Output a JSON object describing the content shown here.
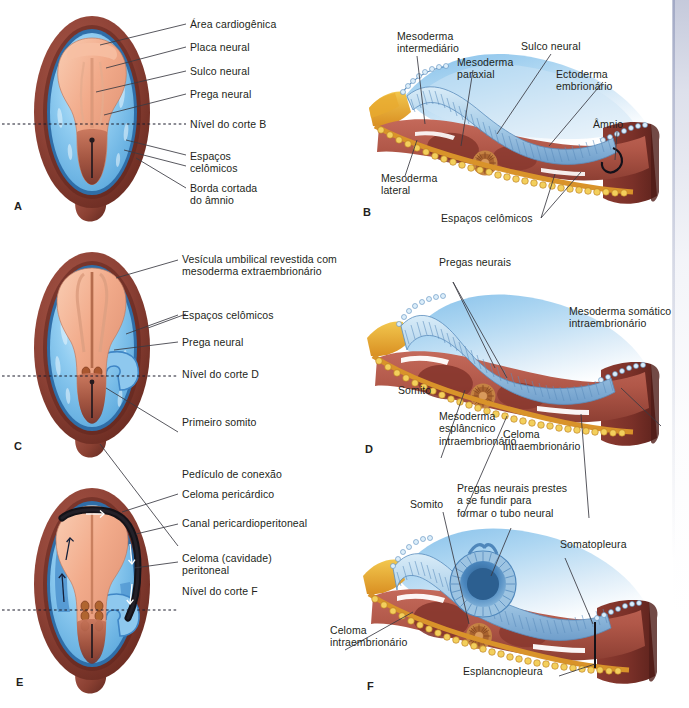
{
  "figure": {
    "language": "pt-BR",
    "panel_count": 6
  },
  "colors": {
    "amnion_cut_edge": "#8e4236",
    "amnion_cut_edge_dark": "#6d2f27",
    "celomic_blue": "#7ec3ef",
    "celomic_blue_light": "#b9e0f7",
    "celomic_blue_dark": "#3f86c6",
    "embryo_disc": "#f0a686",
    "embryo_disc_light": "#f8c7ae",
    "embryo_disc_dark": "#b8604a",
    "mesoderm_red": "#b55a4c",
    "mesoderm_dark": "#8a3b31",
    "ectoderm_blue": "#aecfe8",
    "ectoderm_blue_dark": "#5c8fc0",
    "endoderm_yellow": "#e8b93c",
    "endoderm_orange": "#e59a2a",
    "notochord": "#c07a3c",
    "black_coelom": "#141218",
    "leader_line": "#3a3a42",
    "text": "#231f20",
    "background": "#ffffff"
  },
  "panels": {
    "A": {
      "letter": "A",
      "labels": [
        {
          "text": "Área cardiogênica"
        },
        {
          "text": "Placa neural"
        },
        {
          "text": "Sulco neural"
        },
        {
          "text": "Prega neural"
        },
        {
          "text": "Nível do corte B"
        },
        {
          "text": "Espaços\ncelômicos"
        },
        {
          "text": "Borda cortada\ndo âmnio"
        }
      ]
    },
    "B": {
      "letter": "B",
      "labels": [
        {
          "text": "Mesoderma\nintermediário"
        },
        {
          "text": "Mesoderma\nparaxial"
        },
        {
          "text": "Sulco neural"
        },
        {
          "text": "Ectoderma\nembrionário"
        },
        {
          "text": "Âmnio"
        },
        {
          "text": "Mesoderma\nlateral"
        },
        {
          "text": "Espaços celômicos"
        }
      ]
    },
    "C": {
      "letter": "C",
      "labels": [
        {
          "text": "Vesícula umbilical revestida com\nmesoderma extraembrionário"
        },
        {
          "text": "Espaços celômicos"
        },
        {
          "text": "Prega neural"
        },
        {
          "text": "Nível do corte D"
        },
        {
          "text": "Primeiro somito"
        },
        {
          "text": "Pedículo de conexão"
        }
      ]
    },
    "D": {
      "letter": "D",
      "labels": [
        {
          "text": "Pregas neurais"
        },
        {
          "text": "Mesoderma somático\nintraembrionário"
        },
        {
          "text": "Somito"
        },
        {
          "text": "Mesoderma\nesplâncnico\nintraembrionário"
        },
        {
          "text": "Celoma\nintraembrionário"
        }
      ]
    },
    "E": {
      "letter": "E",
      "labels": [
        {
          "text": "Celoma pericárdico"
        },
        {
          "text": "Canal pericardioperitoneal"
        },
        {
          "text": "Celoma (cavidade)\nperitoneal"
        },
        {
          "text": "Nível do corte F"
        }
      ]
    },
    "F": {
      "letter": "F",
      "labels": [
        {
          "text": "Somito"
        },
        {
          "text": "Pregas neurais prestes\na se fundir para\nformar o tubo neural"
        },
        {
          "text": "Somatopleura"
        },
        {
          "text": "Celoma\nintraembrionário"
        },
        {
          "text": "Esplancnopleura"
        }
      ]
    }
  }
}
